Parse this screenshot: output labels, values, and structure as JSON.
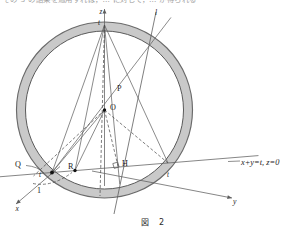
{
  "page": {
    "background_color": "#ffffff",
    "width": 306,
    "height": 233,
    "cropped_text_line": "その 3 の結果を適用すれば，… に対して，… が得られる"
  },
  "figure": {
    "caption": "図　2",
    "type": "geometry-diagram",
    "colors": {
      "annulus_fill": "#c9c9c9",
      "annulus_stroke": "#6a6a6a",
      "inner_circle_stroke": "#555555",
      "line": "#5d5d5d",
      "dashed_line": "#4a4a4a",
      "axis": "#5d5d5d",
      "point": "#111111",
      "text": "#1c1c1c"
    },
    "geometry": {
      "center": {
        "x": 104.5,
        "y": 110.0
      },
      "outer_radius": 88.0,
      "inner_radius": 79.0,
      "apex_top": {
        "x": 104.5,
        "y": 25.0
      },
      "point_O": {
        "x": 104.5,
        "y": 110.0
      },
      "point_P": {
        "x": 113.0,
        "y": 93.0
      },
      "point_H": {
        "x": 118.0,
        "y": 166.0
      },
      "point_R": {
        "x": 75.0,
        "y": 170.5
      },
      "point_t_left": {
        "x": 52.0,
        "y": 172.5
      },
      "point_t_right": {
        "x": 168.0,
        "y": 163.0
      },
      "axis_x_tip": {
        "x": 16.0,
        "y": 204.0
      },
      "axis_y_tip": {
        "x": 232.0,
        "y": 198.0
      },
      "axis_z_tip": {
        "x": 104.5,
        "y": 9.0
      },
      "line_l_tip": {
        "x": 156.0,
        "y": 12.0
      },
      "line_l_bottom": {
        "x": 114.0,
        "y": 214.0
      }
    },
    "labels": [
      {
        "id": "axis-z",
        "text": "z",
        "x": 99.5,
        "y": 14.0,
        "italic": true,
        "size": 7.2
      },
      {
        "id": "apex-t",
        "text": "t",
        "x": 98.0,
        "y": 25.0,
        "italic": true,
        "size": 7.2
      },
      {
        "id": "line-l",
        "text": "l",
        "x": 155.0,
        "y": 14.5,
        "italic": true,
        "size": 7.6
      },
      {
        "id": "point-P",
        "text": "P",
        "x": 117.0,
        "y": 91.0,
        "italic": false,
        "size": 8.2
      },
      {
        "id": "point-O",
        "text": "O",
        "x": 110.0,
        "y": 109.5,
        "italic": false,
        "size": 8.2
      },
      {
        "id": "point-H",
        "text": "H",
        "x": 122.0,
        "y": 166.0,
        "italic": false,
        "size": 8.2
      },
      {
        "id": "point-R",
        "text": "R",
        "x": 68.0,
        "y": 169.0,
        "italic": false,
        "size": 8.2
      },
      {
        "id": "point-Q",
        "text": "Q",
        "x": 15.0,
        "y": 167.0,
        "italic": false,
        "size": 8.2
      },
      {
        "id": "t-left",
        "text": "t",
        "x": 39.0,
        "y": 176.5,
        "italic": true,
        "size": 7.2
      },
      {
        "id": "t-right",
        "text": "t",
        "x": 167.0,
        "y": 177.0,
        "italic": true,
        "size": 7.2
      },
      {
        "id": "value-one",
        "text": "1",
        "x": 37.0,
        "y": 193.0,
        "italic": false,
        "size": 8.0
      },
      {
        "id": "axis-x",
        "text": "x",
        "x": 15.5,
        "y": 210.5,
        "italic": true,
        "size": 7.6
      },
      {
        "id": "axis-y",
        "text": "y",
        "x": 233.0,
        "y": 204.0,
        "italic": true,
        "size": 7.6
      },
      {
        "id": "plane-equation",
        "text": "x+y=t,  z=0",
        "x": 241.0,
        "y": 164.5,
        "italic": true,
        "size": 8.4
      }
    ]
  }
}
